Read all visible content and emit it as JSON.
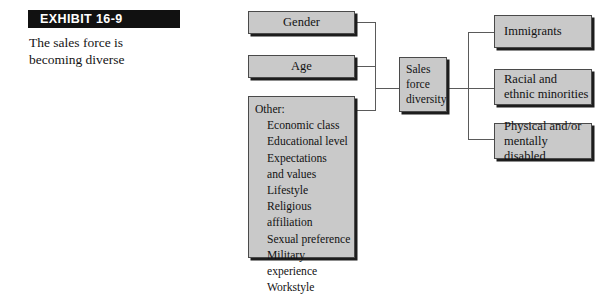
{
  "exhibit": {
    "badge_label": "EXHIBIT 16-9",
    "caption_line1": "The sales force is",
    "caption_line2": "becoming diverse"
  },
  "colors": {
    "box_fill": "#c9c9c9",
    "box_border": "#4a4a4a",
    "box_shadow": "#1d1d1d",
    "badge_background": "#111111",
    "badge_text": "#ffffff",
    "connector": "#5a5a5a"
  },
  "diagram": {
    "inputs": [
      {
        "id": "gender",
        "label": "Gender"
      },
      {
        "id": "age",
        "label": "Age"
      }
    ],
    "other": {
      "heading": "Other:",
      "items": [
        "Economic class",
        "Educational level",
        "Expectations\nand values",
        "Lifestyle",
        "Religious affiliation",
        "Sexual preference",
        "Military experience",
        "Workstyle"
      ]
    },
    "core": {
      "id": "sales-force-diversity",
      "label": "Sales\nforce\ndiversity"
    },
    "outputs": [
      {
        "id": "immigrants",
        "label": "Immigrants"
      },
      {
        "id": "racial-ethnic-minorities",
        "label": "Racial and\nethnic minorities"
      },
      {
        "id": "physical-mentally-disabled",
        "label": "Physical and/or\nmentally disabled"
      }
    ]
  }
}
